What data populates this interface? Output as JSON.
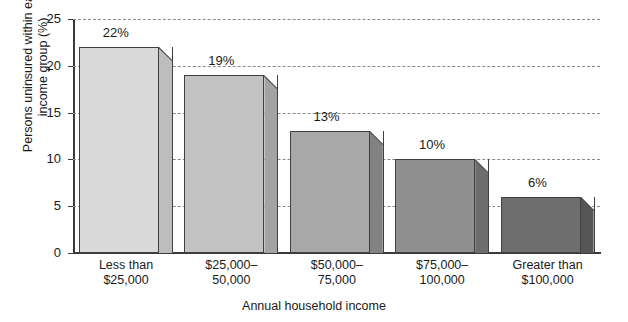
{
  "chart_data": {
    "type": "bar",
    "title": "",
    "xlabel": "Annual household income",
    "ylabel_line1": "Persons uninsured within each",
    "ylabel_line2": "income group (%)",
    "categories": [
      {
        "line1": "Less than",
        "line2": "$25,000"
      },
      {
        "line1": "$25,000–",
        "line2": "50,000"
      },
      {
        "line1": "$50,000–",
        "line2": "75,000"
      },
      {
        "line1": "$75,000–",
        "line2": "100,000"
      },
      {
        "line1": "Greater than",
        "line2": "$100,000"
      }
    ],
    "values": [
      22,
      19,
      13,
      10,
      6
    ],
    "data_labels": [
      "22%",
      "19%",
      "13%",
      "10%",
      "6%"
    ],
    "ylim": [
      0,
      25
    ],
    "yticks": [
      0,
      5,
      10,
      15,
      20,
      25
    ],
    "ytick_labels": [
      "0",
      "5",
      "10",
      "15",
      "20",
      "25"
    ],
    "grid": true,
    "grid_style": "dashed",
    "legend": "none",
    "bar_face_colors": [
      "#d9d9d9",
      "#c2c2c2",
      "#a8a8a8",
      "#8f8f8f",
      "#6e6e6e"
    ],
    "bar_side_colors": [
      "#bdbdbd",
      "#a3a3a3",
      "#828282",
      "#6d6d6d",
      "#555555"
    ],
    "axis_color": "#3a3a3a",
    "grid_color": "#8a8a8a",
    "text_color": "#1a1a1a"
  }
}
